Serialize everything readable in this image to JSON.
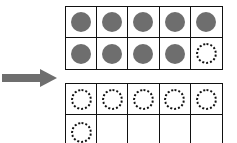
{
  "diagram": {
    "arrow": {
      "direction": "right",
      "color": "#6e6e6e"
    },
    "top_frame": {
      "rows": 2,
      "cols": 5,
      "cells": [
        "filled",
        "filled",
        "filled",
        "filled",
        "filled",
        "filled",
        "filled",
        "filled",
        "filled",
        "empty-counter"
      ]
    },
    "bottom_frame": {
      "rows": 2,
      "cols": 5,
      "cells": [
        "empty-counter",
        "empty-counter",
        "empty-counter",
        "empty-counter",
        "empty-counter",
        "empty-counter",
        "blank",
        "blank",
        "blank",
        "blank"
      ]
    },
    "colors": {
      "counter_fill": "#6e6e6e",
      "grid_line": "#111111"
    }
  }
}
